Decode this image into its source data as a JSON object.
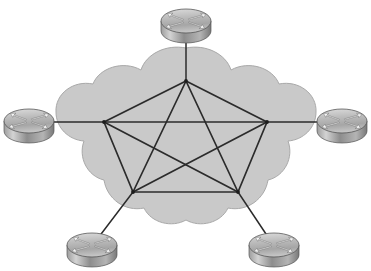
{
  "diagram": {
    "type": "network-topology",
    "cloud": {
      "label": "network-cloud",
      "fill_color": "#c9c9c9",
      "outline_color": "#a9a9a9",
      "bounds": {
        "x": 55,
        "y": 48,
        "width": 265,
        "height": 178
      }
    },
    "link_color": "#2b2b2b",
    "background_color": "#ffffff",
    "mesh_nodes": [
      {
        "id": "n-top",
        "label": "top node",
        "x": 186,
        "y": 81
      },
      {
        "id": "n-left",
        "label": "left node",
        "x": 104,
        "y": 122
      },
      {
        "id": "n-right",
        "label": "right node",
        "x": 267,
        "y": 122
      },
      {
        "id": "n-bottom-left",
        "label": "bottom left node",
        "x": 133,
        "y": 192
      },
      {
        "id": "n-bottom-right",
        "label": "bottom right node",
        "x": 238,
        "y": 192
      }
    ],
    "mesh_links": [
      {
        "from": "n-top",
        "to": "n-left"
      },
      {
        "from": "n-top",
        "to": "n-right"
      },
      {
        "from": "n-top",
        "to": "n-bottom-left"
      },
      {
        "from": "n-top",
        "to": "n-bottom-right"
      },
      {
        "from": "n-left",
        "to": "n-right"
      },
      {
        "from": "n-left",
        "to": "n-bottom-left"
      },
      {
        "from": "n-left",
        "to": "n-bottom-right"
      },
      {
        "from": "n-right",
        "to": "n-bottom-left"
      },
      {
        "from": "n-right",
        "to": "n-bottom-right"
      },
      {
        "from": "n-bottom-left",
        "to": "n-bottom-right"
      }
    ],
    "routers": [
      {
        "id": "r-top",
        "label": "top router",
        "x": 186,
        "y": 22,
        "connects_to": "n-top"
      },
      {
        "id": "r-left",
        "label": "left router",
        "x": 29,
        "y": 122,
        "connects_to": "n-left"
      },
      {
        "id": "r-right",
        "label": "right router",
        "x": 342,
        "y": 122,
        "connects_to": "n-right"
      },
      {
        "id": "r-bottom-left",
        "label": "bottom left router",
        "x": 92,
        "y": 246,
        "connects_to": "n-bottom-left"
      },
      {
        "id": "r-bottom-right",
        "label": "bottom right router",
        "x": 274,
        "y": 246,
        "connects_to": "n-bottom-right"
      }
    ],
    "router_icon": {
      "name": "cisco-router-icon",
      "shape": "3d-cylinder-with-four-arrows",
      "top_fill": "#b9b9b9",
      "side_fill": "#8f8f8f",
      "arrow_color": "#f2f2f2",
      "outline_color": "#4a4a4a",
      "radius_x": 25,
      "radius_y": 12,
      "body_height": 12
    }
  },
  "chart_data": {
    "type": "diagram",
    "node_count": 5,
    "link_count": 10,
    "topology": "full mesh (pentagon with all diagonals)"
  }
}
